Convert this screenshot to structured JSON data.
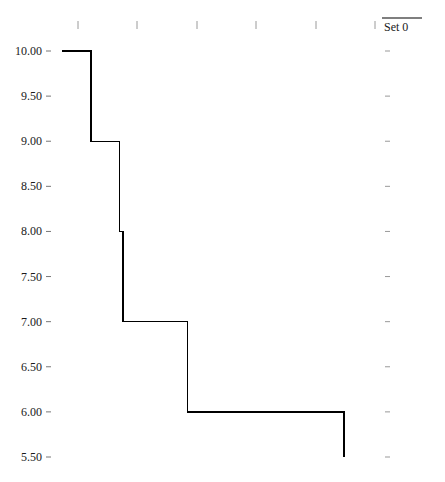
{
  "chart_data": {
    "type": "line",
    "subtype": "step",
    "title": "",
    "xlabel": "",
    "ylabel": "",
    "legend": {
      "position": "top-right",
      "entries": [
        "Set 0"
      ]
    },
    "grid": false,
    "y_ticks": [
      "10.00",
      "9.50",
      "9.00",
      "8.50",
      "8.00",
      "7.50",
      "7.00",
      "6.50",
      "6.00",
      "5.50"
    ],
    "y_tick_values": [
      10.0,
      9.5,
      9.0,
      8.5,
      8.0,
      7.5,
      7.0,
      6.5,
      6.0,
      5.5
    ],
    "x_ticks": [
      "",
      "",
      "",
      "",
      "",
      ""
    ],
    "x_tick_positions": [
      1,
      2,
      3,
      4,
      5,
      6
    ],
    "ylim": [
      5.5,
      10.0
    ],
    "xlim": [
      0.73,
      6.0
    ],
    "series": [
      {
        "name": "Set 0",
        "color": "#000000",
        "step_points": [
          {
            "x": 0.73,
            "y": 10.0
          },
          {
            "x": 1.22,
            "y": 10.0
          },
          {
            "x": 1.22,
            "y": 9.0
          },
          {
            "x": 1.7,
            "y": 9.0
          },
          {
            "x": 1.7,
            "y": 8.0
          },
          {
            "x": 1.76,
            "y": 8.0
          },
          {
            "x": 1.76,
            "y": 7.0
          },
          {
            "x": 2.84,
            "y": 7.0
          },
          {
            "x": 2.84,
            "y": 6.0
          },
          {
            "x": 5.48,
            "y": 6.0
          },
          {
            "x": 5.48,
            "y": 5.5
          }
        ],
        "levels": [
          {
            "y": 10.0,
            "x_start": 0.73,
            "x_end": 1.22
          },
          {
            "y": 9.0,
            "x_start": 1.22,
            "x_end": 1.7
          },
          {
            "y": 8.0,
            "x_start": 1.7,
            "x_end": 1.76
          },
          {
            "y": 7.0,
            "x_start": 1.76,
            "x_end": 2.84
          },
          {
            "y": 6.0,
            "x_start": 2.84,
            "x_end": 5.48
          }
        ]
      }
    ]
  },
  "layout": {
    "plot_left_px": 62,
    "plot_right_px": 388,
    "y_top_px": 51,
    "y_bottom_px": 457,
    "x_tick_px": [
      78,
      137,
      197,
      256,
      316,
      375
    ],
    "x_origin_px": 18.6,
    "x_unit_px": 59.4,
    "x_tick_row_px": 25,
    "right_tick_px": 388
  }
}
